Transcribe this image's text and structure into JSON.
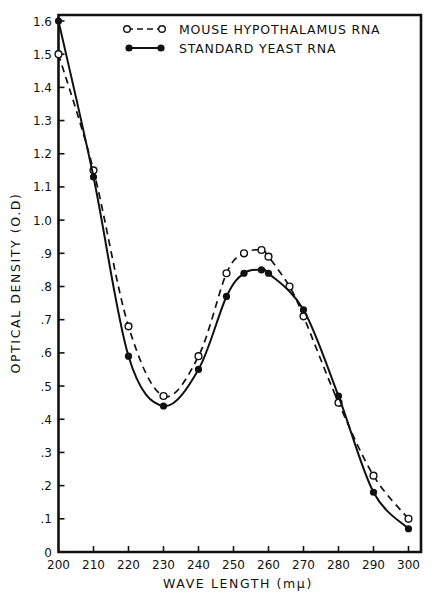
{
  "chart_data": {
    "type": "line",
    "title": "",
    "xlabel": "WAVE LENGTH (mμ)",
    "ylabel": "OPTICAL DENSITY (O.D)",
    "xlim": [
      200,
      300
    ],
    "ylim": [
      0,
      1.6
    ],
    "grid": false,
    "legend_position": "top-right (inside plot)",
    "x_ticks": [
      200,
      210,
      220,
      230,
      240,
      250,
      260,
      270,
      280,
      290,
      300
    ],
    "x_tick_labels": [
      "200",
      "210",
      "220",
      "230",
      "240",
      "250",
      "260",
      "270",
      "280",
      "290",
      "300"
    ],
    "y_ticks": [
      0,
      0.1,
      0.2,
      0.3,
      0.4,
      0.5,
      0.6,
      0.7,
      0.8,
      0.9,
      1.0,
      1.1,
      1.2,
      1.3,
      1.4,
      1.5,
      1.6
    ],
    "y_tick_labels": [
      "0",
      ".1",
      ".2",
      ".3",
      ".4",
      ".5",
      ".6",
      ".7",
      ".8",
      ".9",
      "1.0",
      "1.1",
      "1.2",
      "1.3",
      "1.4",
      "1.5",
      "1.6"
    ],
    "series": [
      {
        "name": "MOUSE HYPOTHALAMUS RNA",
        "line_style": "dashed",
        "marker": "open-circle",
        "color": "#111111",
        "x": [
          200,
          210,
          220,
          230,
          240,
          248,
          253,
          258,
          260,
          266,
          270,
          280,
          290,
          300
        ],
        "values": [
          1.5,
          1.15,
          0.68,
          0.47,
          0.59,
          0.84,
          0.9,
          0.91,
          0.89,
          0.8,
          0.71,
          0.45,
          0.23,
          0.1
        ]
      },
      {
        "name": "STANDARD YEAST RNA",
        "line_style": "solid",
        "marker": "filled-circle",
        "color": "#111111",
        "x": [
          200,
          210,
          220,
          230,
          240,
          248,
          253,
          258,
          260,
          270,
          280,
          290,
          300
        ],
        "values": [
          1.6,
          1.13,
          0.59,
          0.44,
          0.55,
          0.77,
          0.84,
          0.85,
          0.84,
          0.73,
          0.47,
          0.18,
          0.07
        ]
      }
    ]
  },
  "legend": {
    "items": [
      {
        "label": "MOUSE HYPOTHALAMUS RNA",
        "style": "dashed-open"
      },
      {
        "label": "STANDARD YEAST RNA",
        "style": "solid-filled"
      }
    ]
  },
  "axes": {
    "x_title": "WAVE LENGTH (mμ)",
    "y_title": "OPTICAL DENSITY (O.D)"
  }
}
